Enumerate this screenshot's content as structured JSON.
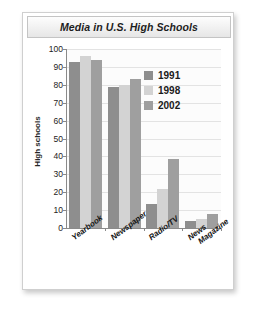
{
  "panel": {
    "title": "Media in U.S. High Schools"
  },
  "chart_data": {
    "type": "bar",
    "title": "Media in U.S. High Schools",
    "xlabel": "",
    "ylabel": "High schools",
    "ylim": [
      0,
      100
    ],
    "yticks": [
      0,
      10,
      20,
      30,
      40,
      50,
      60,
      70,
      80,
      90,
      100
    ],
    "ytick_labels": [
      "0",
      "10",
      "20",
      "30",
      "40",
      "50",
      "60",
      "70",
      "80",
      "90",
      "100"
    ],
    "grid": true,
    "legend_position": "top-right",
    "categories": [
      "Yearbook",
      "Newspaper",
      "Radio/TV",
      "News Magazine"
    ],
    "category_label_lines": [
      [
        "Yearbook"
      ],
      [
        "Newspaper"
      ],
      [
        "Radio/TV"
      ],
      [
        "News",
        "Magazine"
      ]
    ],
    "series": [
      {
        "name": "1991",
        "color": "#8e8e8e",
        "values": [
          93,
          79,
          13.5,
          4
        ]
      },
      {
        "name": "1998",
        "color": "#d3d3d3",
        "values": [
          96,
          80,
          22,
          5
        ]
      },
      {
        "name": "2002",
        "color": "#9f9f9f",
        "values": [
          94,
          83,
          38.5,
          8
        ]
      }
    ]
  }
}
